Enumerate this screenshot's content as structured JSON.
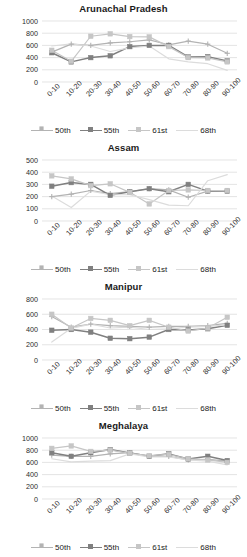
{
  "figure": {
    "name": "small-multiples-line-charts",
    "panel_count": 4,
    "x_categories": [
      "0-10",
      "10-20",
      "20-30",
      "30-40",
      "40-50",
      "50-60",
      "60-70",
      "70-80",
      "80-90",
      "90-100"
    ],
    "legend_labels": [
      "50th",
      "55th",
      "61st",
      "68th"
    ],
    "colors": {
      "series_50th": "#b3b3b3",
      "series_55th": "#808080",
      "series_61st": "#c6c6c6",
      "series_68th": "#dcdcdc",
      "gridline": "#d9d9d9",
      "axis_text": "#2b2b2b",
      "title_text": "#1a1a1a",
      "background": "#ffffff"
    }
  },
  "chart_data": [
    {
      "type": "line",
      "title": "Arunachal Pradesh",
      "xlabel": "",
      "ylabel": "",
      "ylim": [
        0,
        1000
      ],
      "yticks": [
        0,
        200,
        400,
        600,
        800,
        1000
      ],
      "grid": true,
      "legend_position": "bottom",
      "categories": [
        "0-10",
        "10-20",
        "20-30",
        "30-40",
        "40-50",
        "50-60",
        "60-70",
        "70-80",
        "80-90",
        "90-100"
      ],
      "series": [
        {
          "name": "50th",
          "values": [
            490,
            620,
            600,
            640,
            660,
            690,
            610,
            670,
            620,
            470
          ]
        },
        {
          "name": "55th",
          "values": [
            480,
            330,
            400,
            430,
            580,
            600,
            600,
            410,
            415,
            345
          ]
        },
        {
          "name": "61st",
          "values": [
            520,
            340,
            750,
            790,
            745,
            740,
            580,
            400,
            395,
            330
          ]
        },
        {
          "name": "68th",
          "values": [
            590,
            625,
            590,
            500,
            560,
            590,
            380,
            330,
            300,
            190
          ]
        }
      ]
    },
    {
      "type": "line",
      "title": "Assam",
      "xlabel": "",
      "ylabel": "",
      "ylim": [
        0,
        500
      ],
      "yticks": [
        0,
        100,
        200,
        300,
        400,
        500
      ],
      "grid": true,
      "legend_position": "bottom",
      "categories": [
        "0-10",
        "10-20",
        "20-30",
        "30-40",
        "40-50",
        "50-60",
        "60-70",
        "70-80",
        "80-90",
        "90-100"
      ],
      "series": [
        {
          "name": "50th",
          "values": [
            200,
            220,
            250,
            225,
            240,
            265,
            255,
            195,
            245,
            250
          ]
        },
        {
          "name": "55th",
          "values": [
            285,
            315,
            300,
            210,
            240,
            265,
            240,
            300,
            245,
            245
          ]
        },
        {
          "name": "61st",
          "values": [
            370,
            345,
            290,
            305,
            235,
            140,
            250,
            255,
            250,
            250
          ]
        },
        {
          "name": "68th",
          "values": [
            205,
            110,
            245,
            215,
            215,
            175,
            130,
            125,
            330,
            380
          ]
        }
      ]
    },
    {
      "type": "line",
      "title": "Manipur",
      "xlabel": "",
      "ylabel": "",
      "ylim": [
        0,
        800
      ],
      "yticks": [
        0,
        200,
        400,
        600,
        800
      ],
      "grid": true,
      "legend_position": "bottom",
      "categories": [
        "0-10",
        "10-20",
        "20-30",
        "30-40",
        "40-50",
        "50-60",
        "60-70",
        "70-80",
        "80-90",
        "90-100"
      ],
      "series": [
        {
          "name": "50th",
          "values": [
            570,
            430,
            470,
            450,
            440,
            430,
            440,
            440,
            450,
            480
          ]
        },
        {
          "name": "55th",
          "values": [
            390,
            400,
            365,
            285,
            280,
            300,
            400,
            395,
            410,
            455
          ]
        },
        {
          "name": "61st",
          "values": [
            600,
            420,
            545,
            520,
            450,
            520,
            430,
            380,
            420,
            560
          ]
        },
        {
          "name": "68th",
          "values": [
            235,
            415,
            470,
            420,
            430,
            400,
            410,
            430,
            440,
            460
          ]
        }
      ]
    },
    {
      "type": "line",
      "title": "Meghalaya",
      "xlabel": "",
      "ylabel": "",
      "ylim": [
        0,
        1000
      ],
      "yticks": [
        0,
        200,
        400,
        600,
        800,
        1000
      ],
      "grid": true,
      "legend_position": "bottom",
      "categories": [
        "0-10",
        "10-20",
        "20-30",
        "30-40",
        "40-50",
        "50-60",
        "60-70",
        "70-80",
        "80-90",
        "90-100"
      ],
      "series": [
        {
          "name": "50th",
          "values": [
            720,
            700,
            700,
            740,
            760,
            700,
            700,
            640,
            650,
            620
          ]
        },
        {
          "name": "55th",
          "values": [
            760,
            700,
            760,
            810,
            755,
            700,
            740,
            655,
            700,
            630
          ]
        },
        {
          "name": "61st",
          "values": [
            830,
            870,
            780,
            800,
            750,
            710,
            730,
            660,
            640,
            600
          ]
        },
        {
          "name": "68th",
          "values": [
            660,
            610,
            620,
            630,
            740,
            690,
            690,
            640,
            620,
            560
          ]
        }
      ]
    }
  ]
}
